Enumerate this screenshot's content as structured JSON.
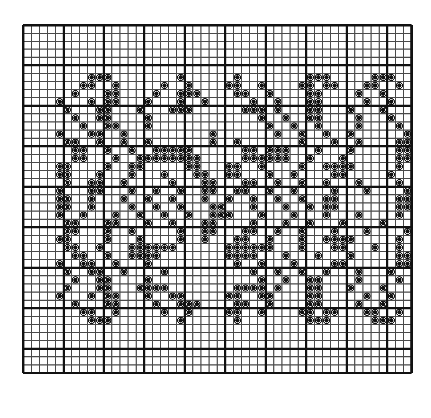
{
  "document": {
    "type": "pattern-chart",
    "title": "Filet Crochet Grid Pattern Chart",
    "description": "Black and white square grid chart with filled dot symbols marking stitches"
  },
  "chart_data": {
    "type": "heatmap",
    "title": "Filet Crochet Grid Pattern Chart",
    "subtitle": "",
    "xlabel": "",
    "ylabel": "",
    "grid": true,
    "legend": "none",
    "cols": 48,
    "rows": 43,
    "cell_size_px": 8.1,
    "origin_px": [
      21,
      23
    ],
    "major_line_every": 5,
    "colors": {
      "background": "#ffffff",
      "minor_grid": "#4a4a4a",
      "major_grid": "#111111",
      "border": "#111111",
      "dot": "#111111"
    },
    "line_widths": {
      "minor": 1.1,
      "major": 2.2,
      "border": 2.4
    },
    "dot": {
      "shape": "circle",
      "radius_px": 2.1,
      "ring": true
    },
    "major_col_lines": [
      0,
      5,
      10,
      15,
      20,
      25,
      30,
      35,
      40,
      45,
      48
    ],
    "major_row_lines": [
      0,
      5,
      10,
      15,
      20,
      25,
      30,
      35,
      40,
      43
    ],
    "xticks": [],
    "yticks": [],
    "values_note": "1 = filled stitch dot, 0 = empty cell. Rows listed top to bottom, 48 columns each.",
    "cells": [
      "000000000000000000000000000000000000000000000000",
      "000000000000000000000000000000000000000000000000",
      "000000000000000000000000000000000000000000000000",
      "000000000000000000000000000000000000000000000000",
      "000000000000000000000000000000000000000000000000",
      "000000000000000000000000000000000000000000000000",
      "000000001110000000010000001000000001110000011100",
      "000000011001000001001000011001000011011000110010",
      "000000100011000010011100001100100001100001001000",
      "000010001011000100010010000010010001100000100100",
      "000001000110001000111000000111010001100010001000",
      "000000100110000100000000000001001001100001000100",
      "000000010011000100000000000000100100100001000010",
      "000010001100100000000001000000010010010010000001",
      "000001100100100100000001001000000010001001000011",
      "000000110010010011111000000110111000100010000011",
      "000000110001001111111100000111111001000100000011",
      "000011000010011000001100011001000010011110000010",
      "000011000100010001000110011000100100001100000100",
      "000001001100100000100011000110010010010001000010",
      "000010001100010010010011001100100100001000100001",
      "000011001000100100100010010010010010011000000011",
      "000011001000010010010001100010001001011000000011",
      "000010010001001001001001110001000100010001000010",
      "000001100011000100100011000010001001000100001000",
      "000001100010010000010011000110010010001000100001",
      "000011000010001000010010001100100010011110000010",
      "000001100100011111100000011111100010001100010010",
      "000000110010011110000000011110001000100010000011",
      "000010011001000100000000001001000100001100000011",
      "000001001100100001000000000010010010010001000100",
      "000000100110000100000000000001001001100001000010",
      "000001000110001111000000001111010001100010001000",
      "000010001011000100110000011001100001100000100100",
      "000000100011000010011100001100100001100001001000",
      "000000011001000001001000011001000011011000110010",
      "000000001110000000010000001000000001110000011100",
      "000000000000000000000000000000000000000000000000",
      "000000000000000000000000000000000000000000000000",
      "000000000000000000000000000000000000000000000000",
      "000000000000000000000000000000000000000000000000",
      "000000000000000000000000000000000000000000000000",
      "000000000000000000000000000000000000000000000000"
    ]
  }
}
